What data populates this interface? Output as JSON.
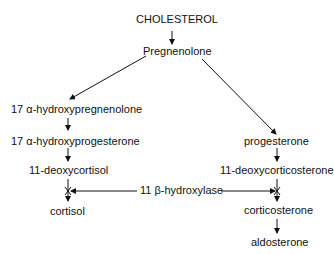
{
  "diagram": {
    "nodes": {
      "cholesterol": "CHOLESTEROL",
      "pregnenolone": "Pregnenolone",
      "hydroxypregnenolone": "17 α-hydroxypregnenolone",
      "hydroxyprogesterone": "17 α-hydroxyprogesterone",
      "deoxycortisol": "11-deoxycortisol",
      "cortisol": "cortisol",
      "progesterone": "progesterone",
      "deoxycorticosterone": "11-deoxycorticosterone",
      "corticosterone": "corticosterone",
      "aldosterone": "aldosterone"
    },
    "enzyme": "11 β-hydroxylase",
    "edges": [
      [
        "cholesterol",
        "pregnenolone"
      ],
      [
        "pregnenolone",
        "hydroxypregnenolone"
      ],
      [
        "pregnenolone",
        "progesterone"
      ],
      [
        "hydroxypregnenolone",
        "hydroxyprogesterone"
      ],
      [
        "hydroxyprogesterone",
        "deoxycortisol"
      ],
      [
        "deoxycortisol",
        "cortisol",
        "blocked"
      ],
      [
        "progesterone",
        "deoxycorticosterone"
      ],
      [
        "deoxycorticosterone",
        "corticosterone",
        "blocked"
      ],
      [
        "corticosterone",
        "aldosterone"
      ]
    ]
  }
}
